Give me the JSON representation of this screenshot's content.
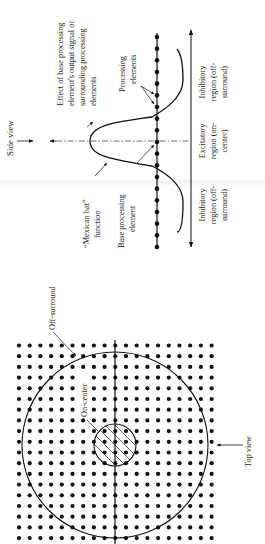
{
  "figure": {
    "side_view": {
      "view_label": "Side view",
      "effect_label": [
        "Effect of base processing",
        "element's output signal or",
        "surrounding processing",
        "elements"
      ],
      "processing_elements_label": [
        "Processing",
        "elements"
      ],
      "mexican_hat_label": [
        "“Mexican hat”",
        "function"
      ],
      "base_element_label": [
        "Base processing",
        "element"
      ],
      "regions": [
        {
          "name": "inhibitory-right",
          "lines": [
            "Inhibitory",
            "region (off-",
            "surround)"
          ]
        },
        {
          "name": "excitatory",
          "lines": [
            "Excitatory",
            "region (on-",
            "center)"
          ]
        },
        {
          "name": "inhibitory-left",
          "lines": [
            "Inhibitory",
            "region (off-",
            "surround)"
          ]
        }
      ],
      "dot_count": 19
    },
    "top_view": {
      "view_label": "Top view",
      "off_surround_label": "Off-surround",
      "on_center_label": "On-center",
      "grid_columns": 19,
      "grid_rows": 19
    },
    "colors": {
      "ink": "#111111",
      "background": "#ffffff"
    }
  }
}
